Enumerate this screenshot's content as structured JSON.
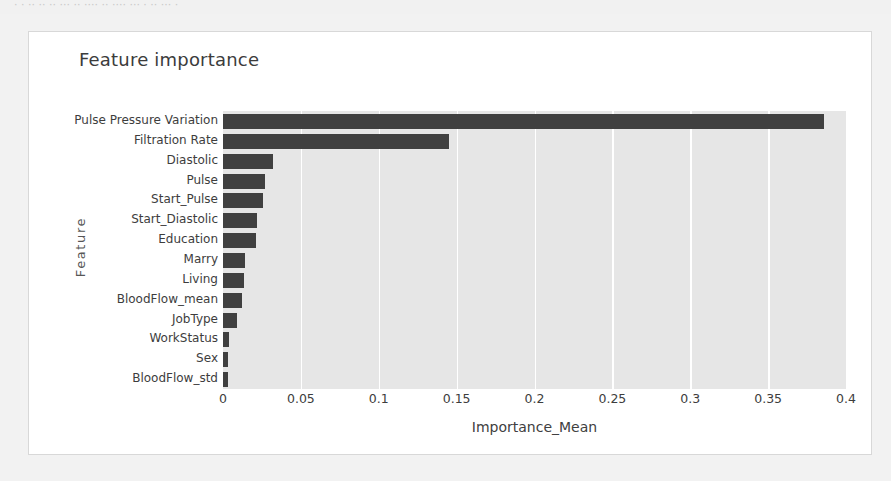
{
  "page": {
    "background_color": "#f2f2f2",
    "top_cut_text": "· · ·· ·· ·· ··· ·· ···· ·· ···· ··· · ·· ··· ·"
  },
  "card": {
    "background_color": "#ffffff",
    "border_color": "#d8d8d8"
  },
  "chart_data": {
    "type": "bar",
    "orientation": "horizontal",
    "title": "Feature importance",
    "xlabel": "Importance_Mean",
    "ylabel": "Feature",
    "xlim": [
      0,
      0.4
    ],
    "ylim": null,
    "grid": true,
    "grid_color": "#ffffff",
    "plot_background": "#e6e6e6",
    "bar_color": "#404040",
    "legend": null,
    "xticks": [
      0,
      0.05,
      0.1,
      0.15,
      0.2,
      0.25,
      0.3,
      0.35,
      0.4
    ],
    "xtick_labels": [
      "0",
      "0.05",
      "0.1",
      "0.15",
      "0.2",
      "0.25",
      "0.3",
      "0.35",
      "0.4"
    ],
    "categories": [
      "Pulse Pressure Variation",
      "Filtration Rate",
      "Diastolic",
      "Pulse",
      "Start_Pulse",
      "Start_Diastolic",
      "Education",
      "Marry",
      "Living",
      "BloodFlow_mean",
      "JobType",
      "WorkStatus",
      "Sex",
      "BloodFlow_std"
    ],
    "values": [
      0.386,
      0.145,
      0.032,
      0.027,
      0.026,
      0.022,
      0.021,
      0.014,
      0.0135,
      0.012,
      0.009,
      0.004,
      0.0035,
      0.003
    ]
  }
}
